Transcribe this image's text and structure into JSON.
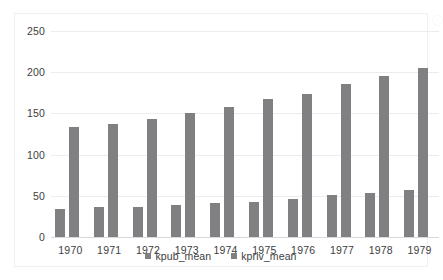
{
  "chart_data": {
    "type": "bar",
    "title": "",
    "subtitle": "",
    "xlabel": "",
    "ylabel": "",
    "categories": [
      "1970",
      "1971",
      "1972",
      "1973",
      "1974",
      "1975",
      "1976",
      "1977",
      "1978",
      "1979"
    ],
    "series": [
      {
        "name": "kpub_mean",
        "color": "#808083",
        "values": [
          34,
          36,
          37,
          39,
          41,
          43,
          46,
          51,
          53,
          57
        ]
      },
      {
        "name": "kpriv_mean",
        "color": "#808083",
        "values": [
          133,
          137,
          143,
          150,
          158,
          167,
          174,
          186,
          196,
          205
        ]
      }
    ],
    "ylim": [
      0,
      250
    ],
    "yticks": [
      0,
      50,
      100,
      150,
      200,
      250
    ],
    "ytick_labels": [
      "0",
      "50",
      "100",
      "150",
      "200",
      "250"
    ],
    "grid": true,
    "grid_axis": "y",
    "legend": {
      "position": "bottom",
      "entries": [
        "kpub_mean",
        "kpriv_mean"
      ]
    },
    "plot_background": "#ffffff",
    "gridline_color": "#ececee"
  },
  "card": {
    "border_color": "#f0f0f2",
    "background": "#ffffff"
  }
}
